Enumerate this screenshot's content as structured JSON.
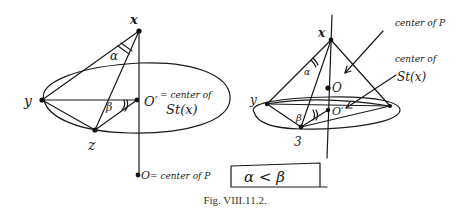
{
  "figure": {
    "caption": "Fig. VIII.11.2.",
    "left_diagram": {
      "labels": {
        "x": "x",
        "y": "y",
        "z": "z",
        "o_prime": "O′",
        "o_prime_note_1": "= center of",
        "o_prime_note_2": "St(x)",
        "o": "O",
        "o_note": "= center of P",
        "alpha": "α",
        "beta": "β"
      }
    },
    "right_diagram": {
      "labels": {
        "x": "x",
        "y": "y",
        "z": "3",
        "o": "O",
        "o_prime": "O′",
        "alpha": "α",
        "beta": "β",
        "center_of_p": "center of P",
        "center_of_st_1": "center of",
        "center_of_st_2": "St(x)"
      }
    },
    "boxed_inequality": "α < β"
  }
}
